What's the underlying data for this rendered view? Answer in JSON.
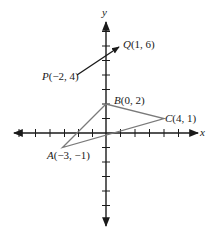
{
  "diagram": {
    "type": "coordinate-plane",
    "axes": {
      "x_label": "x",
      "y_label": "y",
      "x_ticks": [
        -6,
        -5,
        -4,
        -3,
        -2,
        -1,
        1,
        2,
        3,
        4,
        5
      ],
      "y_ticks": [
        -6,
        -5,
        -4,
        -3,
        -2,
        -1,
        1,
        2,
        3,
        4,
        5,
        6,
        7
      ],
      "axis_color": "#1a1a1a"
    },
    "points": [
      {
        "id": "A",
        "label_name": "A",
        "label_coords": "(−3, −1)",
        "x": -3,
        "y": -1
      },
      {
        "id": "B",
        "label_name": "B",
        "label_coords": "(0, 2)",
        "x": 0,
        "y": 2
      },
      {
        "id": "C",
        "label_name": "C",
        "label_coords": "(4, 1)",
        "x": 4,
        "y": 1
      },
      {
        "id": "P",
        "label_name": "P",
        "label_coords": "(−2, 4)",
        "x": -2,
        "y": 4
      },
      {
        "id": "Q",
        "label_name": "Q",
        "label_coords": "(1, 6)",
        "x": 1,
        "y": 6
      }
    ],
    "triangle": {
      "vertices": [
        "A",
        "B",
        "C"
      ],
      "stroke": "#7a7a7a"
    },
    "vector": {
      "from": "P",
      "to": "Q",
      "stroke": "#1a1a1a"
    }
  }
}
